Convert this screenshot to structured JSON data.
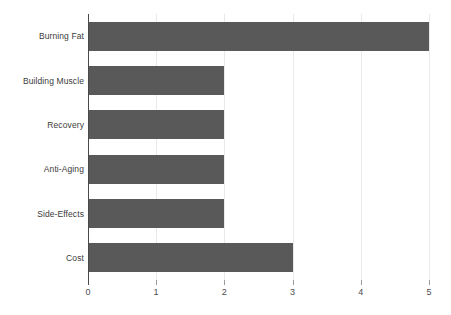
{
  "chart_data": {
    "type": "bar",
    "orientation": "horizontal",
    "title": "",
    "subtitle": "",
    "xlabel": "",
    "ylabel": "",
    "categories": [
      "Burning Fat",
      "Building Muscle",
      "Recovery",
      "Anti-Aging",
      "Side-Effects",
      "Cost"
    ],
    "values": [
      5,
      2,
      2,
      2,
      2,
      3
    ],
    "series": [
      {
        "name": "",
        "values": [
          5,
          2,
          2,
          2,
          2,
          3
        ]
      }
    ],
    "xlim": [
      0,
      5
    ],
    "xticks": [
      0,
      1,
      2,
      3,
      4,
      5
    ],
    "xtick_labels": [
      "0",
      "1",
      "2",
      "3",
      "4",
      "5"
    ],
    "grid": "vertical-only",
    "legend": "none",
    "bar_color": "#595959",
    "gridline_color": "#e9e9e9",
    "axis_color": "#4a4a4a",
    "tick_label_color": "#4d4d4d",
    "category_label_color": "#3b3b3b",
    "background_color": "#ffffff",
    "annotations": []
  }
}
